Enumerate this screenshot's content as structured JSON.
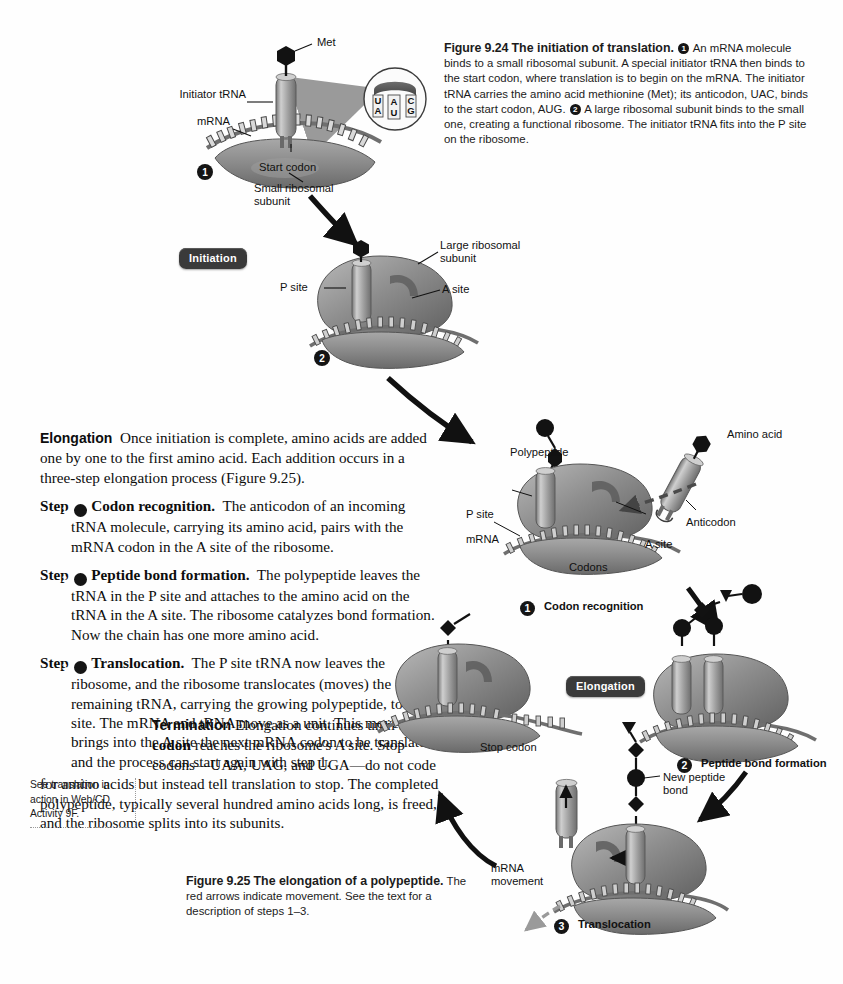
{
  "page": {
    "background": "#ffffff",
    "ink": "#111111",
    "badge_bg": "#3a3a3a"
  },
  "figure_924": {
    "figno": "Figure 9.24",
    "title": "The initiation of translation.",
    "body_1": "An mRNA molecule binds to a small ribosomal subunit. A special initiator tRNA then binds to the start codon, where translation is to begin on the mRNA. The initiator tRNA carries the amino acid methionine (Met); its anticodon, UAC, binds to the start codon, AUG.",
    "body_2": "A large ribosomal subunit binds to the small one, creating a functional ribosome. The initiator tRNA fits into the P site on the ribosome.",
    "marker_1": "1",
    "marker_2": "2"
  },
  "figure_924_art": {
    "step1": {
      "number": "1",
      "labels": {
        "met": "Met",
        "initiator_trna": "Initiator tRNA",
        "mrna": "mRNA",
        "start_codon": "Start codon",
        "small_subunit_line1": "Small ribosomal",
        "small_subunit_line2": "subunit"
      },
      "inset_pairing": {
        "anticodon": [
          "U",
          "A",
          "C"
        ],
        "codon": [
          "A",
          "U",
          "G"
        ]
      }
    },
    "initiation_badge": "Initiation",
    "step2": {
      "number": "2",
      "labels": {
        "large_subunit_line1": "Large ribosomal",
        "large_subunit_line2": "subunit",
        "p_site": "P site",
        "a_site": "A site"
      }
    }
  },
  "text_column": {
    "elongation": {
      "lead": "Elongation",
      "text": "Once initiation is complete, amino acids are added one by one to the first amino acid. Each addition occurs in a three-step elongation process (Figure 9.25)."
    },
    "steps": [
      {
        "label": "Step",
        "number": "1",
        "title": "Codon recognition.",
        "text": "The anticodon of an incoming tRNA molecule, carrying its amino acid, pairs with the mRNA codon in the A site of the ribosome."
      },
      {
        "label": "Step",
        "number": "2",
        "title": "Peptide bond formation.",
        "text": "The polypeptide leaves the tRNA in the P site and attaches to the amino acid on the tRNA in the A site. The ribosome catalyzes bond formation. Now the chain has one more amino acid."
      },
      {
        "label": "Step",
        "number": "3",
        "title": "Translocation.",
        "text": "The P site tRNA now leaves the ribosome, and the ribosome translocates (moves) the remaining tRNA, carrying the growing polypeptide, to the P site. The mRNA and tRNA move as a unit. This movement brings into the A site the next mRNA codon to be translated, and the process can start again with step 1."
      }
    ],
    "termination": {
      "lead": "Termination",
      "text_a": "Elongation continues until a ",
      "bold": "stop codon",
      "text_b": " reaches the ribosome's A site. Stop codons—UAA, UAG, and UGA—do not code for amino acids but instead tell translation to stop. The completed polypeptide, typically several hundred amino acids long, is freed, and the ribosome splits into its subunits."
    },
    "web_note": "See translation in action in Web/CD Activity 9F."
  },
  "figure_925": {
    "figno": "Figure 9.25",
    "title": "The elongation of a polypeptide.",
    "body": "The red arrows indicate movement. See the text for a description of steps 1–3."
  },
  "figure_925_art": {
    "elongation_badge": "Elongation",
    "panel_1": {
      "number": "1",
      "caption": "Codon recognition",
      "labels": {
        "polypeptide": "Polypeptide",
        "amino_acid": "Amino acid",
        "anticodon": "Anticodon",
        "p_site": "P site",
        "a_site": "A site",
        "mrna": "mRNA",
        "codons": "Codons"
      }
    },
    "panel_2": {
      "number": "2",
      "caption": "Peptide bond formation"
    },
    "panel_3": {
      "number": "3",
      "caption": "Translocation",
      "labels": {
        "new_peptide_line1": "New peptide",
        "new_peptide_line2": "bond",
        "mrna_movement_line1": "mRNA",
        "mrna_movement_line2": "movement"
      }
    },
    "panel_4": {
      "labels": {
        "stop_codon": "Stop codon"
      }
    }
  }
}
